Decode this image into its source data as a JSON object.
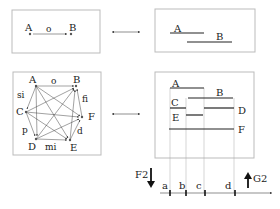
{
  "panels": {
    "top_left": {
      "nodes": [
        {
          "label": "A"
        },
        {
          "label": "B"
        }
      ],
      "relation_label": "o"
    },
    "top_right": {
      "intervals": [
        {
          "label": "A"
        },
        {
          "label": "B"
        }
      ]
    },
    "mid_left": {
      "nodes": [
        {
          "label": "A"
        },
        {
          "label": "B"
        },
        {
          "label": "C"
        },
        {
          "label": "F"
        },
        {
          "label": "D"
        },
        {
          "label": "E"
        }
      ],
      "relation_labels": {
        "o": "o",
        "si": "si",
        "fi": "fi",
        "p": "p",
        "d": "d",
        "mi": "mi"
      }
    },
    "mid_right": {
      "intervals": [
        {
          "label": "A"
        },
        {
          "label": "B"
        },
        {
          "label": "C"
        },
        {
          "label": "D"
        },
        {
          "label": "E"
        },
        {
          "label": "F"
        }
      ]
    }
  },
  "axis": {
    "ticks": [
      {
        "label": "a"
      },
      {
        "label": "b"
      },
      {
        "label": "c"
      },
      {
        "label": "d"
      }
    ],
    "left_arrow_label": "F2",
    "right_arrow_label": "G2"
  },
  "colors": {
    "stroke": "#222222",
    "box": "#bbbbbb",
    "guide": "#aaaaaa"
  }
}
